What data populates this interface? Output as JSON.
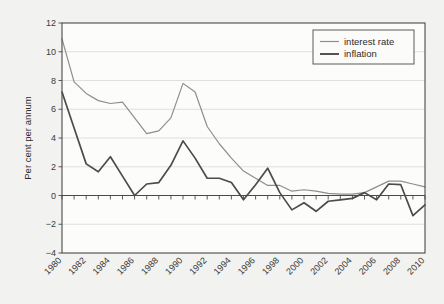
{
  "chart_data": {
    "type": "line",
    "title": "",
    "xlabel": "",
    "ylabel": "Per cent per annum",
    "ylim": [
      -4,
      12
    ],
    "xlim": [
      1980,
      2010
    ],
    "ytick_values": [
      12,
      10,
      8,
      6,
      4,
      2,
      0,
      -2,
      -4
    ],
    "ytick_labels": [
      "12",
      "10",
      "8",
      "6",
      "4",
      "2",
      "0",
      "−2",
      "−4"
    ],
    "xtick_values": [
      1980,
      1982,
      1984,
      1986,
      1988,
      1990,
      1992,
      1994,
      1996,
      1998,
      2000,
      2002,
      2004,
      2006,
      2008,
      2010
    ],
    "xtick_labels": [
      "1980",
      "1982",
      "1984",
      "1986",
      "1988",
      "1990",
      "1992",
      "1994",
      "1996",
      "1998",
      "2000",
      "2002",
      "2004",
      "2006",
      "2008",
      "2010"
    ],
    "grid": true,
    "grid_axis": "y",
    "legend_position": "top-right",
    "x": [
      1980,
      1981,
      1982,
      1983,
      1984,
      1985,
      1986,
      1987,
      1988,
      1989,
      1990,
      1991,
      1992,
      1993,
      1994,
      1995,
      1996,
      1997,
      1998,
      1999,
      2000,
      2001,
      2002,
      2003,
      2004,
      2005,
      2006,
      2007,
      2008,
      2009,
      2010
    ],
    "series": [
      {
        "name": "interest rate",
        "color": "#8e8e8e",
        "values": [
          10.9,
          7.9,
          7.1,
          6.6,
          6.4,
          6.5,
          5.4,
          4.3,
          4.5,
          5.4,
          7.8,
          7.2,
          4.8,
          3.6,
          2.6,
          1.7,
          1.2,
          0.7,
          0.7,
          0.3,
          0.4,
          0.3,
          0.15,
          0.1,
          0.1,
          0.2,
          0.6,
          1.0,
          1.0,
          0.8,
          0.6
        ]
      },
      {
        "name": "inflation",
        "color": "#4b4b4b",
        "values": [
          7.2,
          4.7,
          2.2,
          1.65,
          2.7,
          1.35,
          0.0,
          0.8,
          0.9,
          2.1,
          3.8,
          2.6,
          1.2,
          1.2,
          0.9,
          -0.3,
          0.75,
          1.9,
          0.2,
          -1.0,
          -0.5,
          -1.1,
          -0.4,
          -0.3,
          -0.2,
          0.2,
          -0.3,
          0.8,
          0.75,
          -1.4,
          -0.65
        ]
      }
    ]
  },
  "legend": {
    "items": [
      {
        "label": "interest rate"
      },
      {
        "label": "inflation"
      }
    ]
  }
}
